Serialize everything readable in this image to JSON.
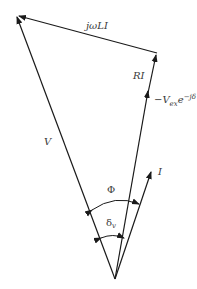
{
  "diagram": {
    "colors": {
      "line": "#1a1a1a",
      "text": "#3a3a3a",
      "background": "#ffffff"
    },
    "labels": {
      "jwLI": "jωLI",
      "RI": "RI",
      "V": "V",
      "Vex_main": "−V",
      "Vex_sub": "ex",
      "Vex_exp": "e",
      "Vex_sup": "−jδ",
      "I": "I",
      "Phi": "Φ",
      "delta": "δ",
      "delta_sub": "v"
    },
    "vectors": [
      {
        "name": "V",
        "from": [
          115,
          279
        ],
        "to": [
          16,
          15
        ]
      },
      {
        "name": "jωLI",
        "from": [
          157,
          53
        ],
        "to": [
          16,
          15
        ]
      },
      {
        "name": "RI",
        "from": [
          148,
          93
        ],
        "to": [
          157,
          53
        ]
      },
      {
        "name": "-Vex e^-jδ",
        "from": [
          115,
          279
        ],
        "to": [
          148,
          93
        ]
      },
      {
        "name": "I",
        "from": [
          115,
          279
        ],
        "to": [
          152,
          172
        ]
      }
    ],
    "angles": [
      {
        "name": "Φ",
        "between": [
          "V",
          "I"
        ]
      },
      {
        "name": "δv",
        "between": [
          "V",
          "-Vex e^-jδ"
        ]
      }
    ]
  }
}
